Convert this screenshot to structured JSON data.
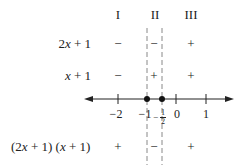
{
  "diagram": {
    "type": "sign-chart",
    "columns": [
      "I",
      "II",
      "III"
    ],
    "rows": [
      {
        "label_parts": [
          "2",
          "x",
          " + 1"
        ],
        "label": "2x + 1",
        "signs": [
          "−",
          "−",
          "+"
        ]
      },
      {
        "label_parts": [
          "",
          "x",
          " + 1"
        ],
        "label": "x + 1",
        "signs": [
          "−",
          "+",
          "+"
        ]
      },
      {
        "label_parts": [
          "(2",
          "x",
          " + 1) ("
        ],
        "label_parts2": [
          "x",
          " + 1)"
        ],
        "label": "(2x + 1) (x + 1)",
        "signs": [
          "+",
          "−",
          "+"
        ]
      }
    ],
    "number_line": {
      "ticks": [
        "−2",
        "−1",
        "0",
        "1"
      ],
      "critical_points": [
        "−1",
        "−1/2"
      ],
      "half_label": {
        "sign": "−",
        "num": "1",
        "den": "2"
      }
    }
  }
}
